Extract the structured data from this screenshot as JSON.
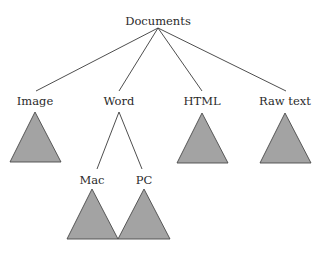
{
  "diagram": {
    "type": "tree",
    "root": {
      "label": "Documents",
      "children": [
        {
          "label": "Image",
          "subtree": "triangle"
        },
        {
          "label": "Word",
          "children": [
            {
              "label": "Mac",
              "subtree": "triangle"
            },
            {
              "label": "PC",
              "subtree": "triangle"
            }
          ]
        },
        {
          "label": "HTML",
          "subtree": "triangle"
        },
        {
          "label": "Raw text",
          "subtree": "triangle"
        }
      ]
    },
    "labels": {
      "root": "Documents",
      "image": "Image",
      "word": "Word",
      "html": "HTML",
      "raw_text": "Raw text",
      "mac": "Mac",
      "pc": "PC"
    },
    "colors": {
      "triangle_fill": "#a3a3a3",
      "triangle_stroke": "#4a4a4a",
      "edge": "#3a3a3a",
      "text": "#2a2a2a",
      "background": "#ffffff"
    }
  }
}
